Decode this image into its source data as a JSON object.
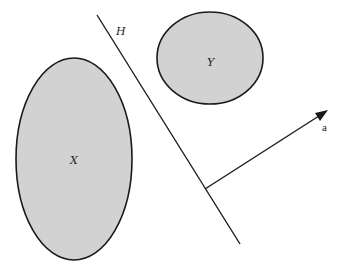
{
  "diagram": {
    "set_x": {
      "label": "X",
      "fill": "#d2d2d2"
    },
    "set_y": {
      "label": "Y",
      "fill": "#d2d2d2"
    },
    "hyperplane": {
      "label": "H"
    },
    "normal_vector": {
      "label": "a"
    },
    "stroke_color": "#1a1a1a"
  }
}
